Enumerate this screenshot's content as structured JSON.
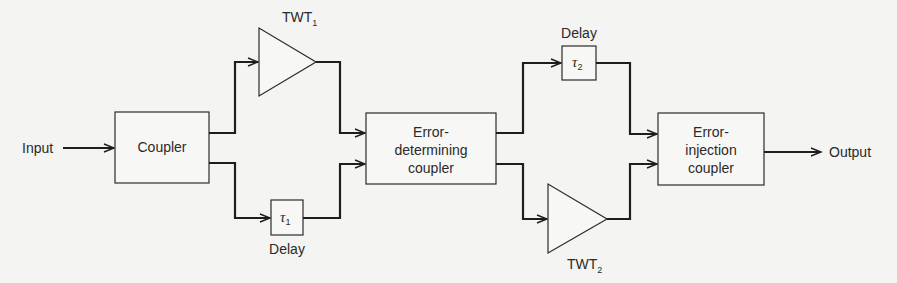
{
  "diagram": {
    "type": "block-diagram",
    "io": {
      "input_label": "Input",
      "output_label": "Output"
    },
    "blocks": {
      "coupler": {
        "label": "Coupler"
      },
      "twt1": {
        "label": "TWT",
        "subscript": "1"
      },
      "delay1": {
        "symbol": "τ",
        "subscript": "1",
        "caption": "Delay"
      },
      "error_determining": {
        "line1": "Error-",
        "line2": "determining",
        "line3": "coupler"
      },
      "delay2": {
        "symbol": "τ",
        "subscript": "2",
        "caption": "Delay"
      },
      "twt2": {
        "label": "TWT",
        "subscript": "2"
      },
      "error_injection": {
        "line1": "Error-",
        "line2": "injection",
        "line3": "coupler"
      }
    },
    "connections": [
      {
        "from": "input",
        "to": "coupler"
      },
      {
        "from": "coupler",
        "to": "twt1"
      },
      {
        "from": "coupler",
        "to": "delay1"
      },
      {
        "from": "twt1",
        "to": "error_determining"
      },
      {
        "from": "delay1",
        "to": "error_determining"
      },
      {
        "from": "error_determining",
        "to": "delay2"
      },
      {
        "from": "error_determining",
        "to": "twt2"
      },
      {
        "from": "delay2",
        "to": "error_injection"
      },
      {
        "from": "twt2",
        "to": "error_injection"
      },
      {
        "from": "error_injection",
        "to": "output"
      }
    ],
    "colors": {
      "line": "#1e1e1e",
      "background": "#f4f4f2"
    }
  }
}
